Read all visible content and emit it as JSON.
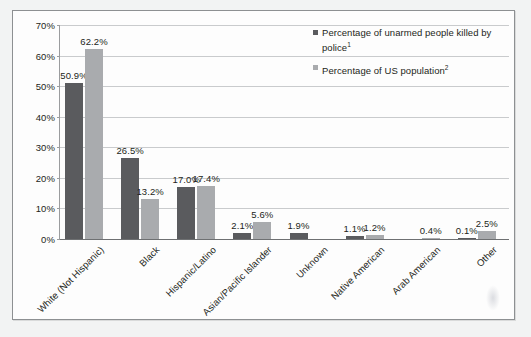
{
  "chart_data": {
    "type": "bar",
    "title": "",
    "subtitle": "",
    "xlabel": "",
    "ylabel": "",
    "ylim": [
      0,
      70
    ],
    "ytick_labels": [
      "0%",
      "10%",
      "20%",
      "30%",
      "40%",
      "50%",
      "60%",
      "70%"
    ],
    "ytick_values": [
      0,
      10,
      20,
      30,
      40,
      50,
      60,
      70
    ],
    "grid": true,
    "legend_position": "top-right",
    "categories": [
      "White (Not Hispanic)",
      "Black",
      "Hispanic/Latino",
      "Asian/Pacific Islander",
      "Unknown",
      "Native American",
      "Arab American",
      "Other"
    ],
    "series": [
      {
        "name": "Percentage of unarmed people killed by police",
        "footnote": "1",
        "color": "#5a5b5e",
        "values": [
          50.9,
          26.5,
          17.0,
          2.1,
          1.9,
          1.1,
          null,
          0.1
        ],
        "labels": [
          "50.9%",
          "26.5%",
          "17.0%",
          "2.1%",
          "1.9%",
          "1.1%",
          "",
          "0.1%"
        ]
      },
      {
        "name": "Percentage of US population",
        "footnote": "2",
        "color": "#a9abae",
        "values": [
          62.2,
          13.2,
          17.4,
          5.6,
          null,
          1.2,
          0.4,
          2.5
        ],
        "labels": [
          "62.2%",
          "13.2%",
          "17.4%",
          "5.6%",
          "",
          "1.2%",
          "0.4%",
          "2.5%"
        ]
      }
    ]
  },
  "legend": {
    "items": [
      {
        "label": "Percentage of unarmed people killed by police",
        "footnote": "1",
        "swatch": "dark"
      },
      {
        "label": "Percentage of US population",
        "footnote": "2",
        "swatch": "light"
      }
    ]
  },
  "colors": {
    "series_dark": "#5a5b5e",
    "series_light": "#a9abae",
    "gridline": "#c9cbcd",
    "axis": "#6e7072",
    "text": "#231f20",
    "figure_background": "#fdfdfd",
    "page_background": "#f2f3f3"
  }
}
